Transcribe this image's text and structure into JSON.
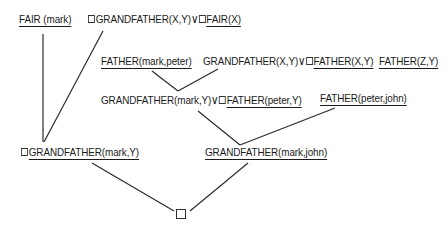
{
  "diagram": {
    "type": "resolution-refutation-tree",
    "nodes": {
      "fair_mark": {
        "text": "FAIR (mark)"
      },
      "clause1": {
        "neg1": "¬",
        "lit1": "GRANDFATHER(X,Y)",
        "or": "∨",
        "neg2": "¬",
        "lit2": "FAIR(X)"
      },
      "father_mark_peter": {
        "text": "FATHER(mark,peter)"
      },
      "clause2": {
        "lit1": "GRANDFATHER(X,Y)",
        "or": "∨",
        "neg": "¬",
        "lit2": "FATHER(X,Y)"
      },
      "father_z_y": {
        "text": "FATHER(Z,Y)"
      },
      "resolvent1": {
        "lit1": "GRANDFATHER(mark,Y)",
        "or": "∨",
        "neg": "¬",
        "lit2": "FATHER(peter,Y)"
      },
      "father_peter_john": {
        "text": "FATHER(peter,john)"
      },
      "resolvent_left": {
        "neg": "¬",
        "lit": "GRANDFATHER(mark,Y)"
      },
      "resolvent_right": {
        "text": "GRANDFATHER(mark,john)"
      },
      "empty_clause": {
        "symbol": "□"
      }
    },
    "edges": [
      {
        "from": "fair_mark",
        "to": "resolvent_left"
      },
      {
        "from": "clause1",
        "to": "resolvent_left"
      },
      {
        "from": "father_mark_peter",
        "to": "resolvent1"
      },
      {
        "from": "clause2",
        "to": "resolvent1"
      },
      {
        "from": "resolvent1",
        "to": "resolvent_right"
      },
      {
        "from": "father_peter_john",
        "to": "resolvent_right"
      },
      {
        "from": "resolvent_left",
        "to": "empty_clause"
      },
      {
        "from": "resolvent_right",
        "to": "empty_clause"
      }
    ],
    "colors": {
      "ink": "#1a1a1a",
      "background": "#ffffff"
    }
  }
}
